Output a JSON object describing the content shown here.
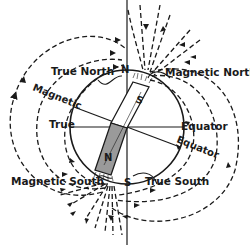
{
  "diagram": {
    "labels": {
      "true_north": "True North",
      "magnetic_north": "Magnetic North",
      "magnetic": "Magnetic",
      "true": "True",
      "equator": "Equator",
      "magnetic_equator": "Equator",
      "magnetic_south": "Magnetic South",
      "true_south": "True South",
      "pole_n": "N",
      "pole_s": "S",
      "magnet_s": "S",
      "magnet_n": "N"
    },
    "colors": {
      "line": "#1a1a1a",
      "magnet_bottom": "#9a9a9a",
      "background": "#ffffff"
    }
  }
}
